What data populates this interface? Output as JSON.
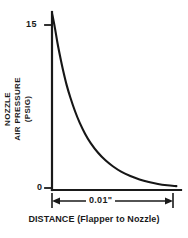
{
  "chart_data": {
    "type": "line",
    "title": "",
    "xlabel": "DISTANCE (Flapper to Nozzle)",
    "ylabel": "NOZZLE AIR PRESSURE (PSIG)",
    "ylabel_lines": [
      "NOZZLE",
      "AIR PRESSURE",
      "(PSIG)"
    ],
    "grid": false,
    "legend": "none",
    "xlim": [
      0,
      0.014
    ],
    "ylim": [
      0,
      16.5
    ],
    "yticks": [
      0,
      15
    ],
    "ytick_labels": [
      "0",
      "15"
    ],
    "xticks": [],
    "xtick_labels": [],
    "annotations": [
      {
        "name": "span-dimension",
        "text": "0.01\"",
        "type": "double-arrow-dimension",
        "from_x": 0.0,
        "to_x": 0.01
      }
    ],
    "series": [
      {
        "name": "Nozzle air pressure",
        "x": [
          0.0,
          0.0003,
          0.0006,
          0.0009,
          0.0012,
          0.0016,
          0.002,
          0.0025,
          0.003,
          0.0036,
          0.0042,
          0.005,
          0.0058,
          0.0066,
          0.0075,
          0.0085,
          0.0095,
          0.0105,
          0.0115,
          0.0125,
          0.0135
        ],
        "y": [
          16.4,
          15.1,
          13.6,
          12.3,
          11.1,
          9.7,
          8.55,
          7.3,
          6.25,
          5.2,
          4.35,
          3.45,
          2.75,
          2.2,
          1.7,
          1.3,
          0.98,
          0.74,
          0.56,
          0.44,
          0.36
        ]
      }
    ]
  },
  "axes": {
    "ytick_top_label": "15",
    "ytick_bottom_label": "0",
    "ylabel_line1": "NOZZLE",
    "ylabel_line2": "AIR PRESSURE",
    "ylabel_line3": "(PSIG)",
    "dimension_label": "0.01\"",
    "xaxis_caption": "DISTANCE (Flapper to Nozzle)"
  },
  "colors": {
    "ink": "#1a1a1a",
    "curve": "#161616",
    "background": "#ffffff"
  }
}
